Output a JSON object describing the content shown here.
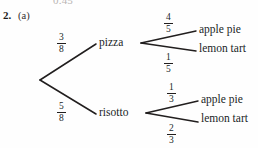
{
  "page": {
    "cut_off_text_above": "0.45",
    "question_number": "2.",
    "question_part": "(a)",
    "ink_color": "#211e1e",
    "background_color": "#fefefe"
  },
  "tree": {
    "root_label": "",
    "level1": [
      {
        "id": "pizza",
        "label": "pizza",
        "probability_numerator": "3",
        "probability_denominator": "8",
        "children": [
          {
            "id": "pizza-apple-pie",
            "label": "apple pie",
            "probability_numerator": "4",
            "probability_denominator": "5"
          },
          {
            "id": "pizza-lemon-tart",
            "label": "lemon tart",
            "probability_numerator": "1",
            "probability_denominator": "5"
          }
        ]
      },
      {
        "id": "risotto",
        "label": "risotto",
        "probability_numerator": "5",
        "probability_denominator": "8",
        "children": [
          {
            "id": "risotto-apple-pie",
            "label": "apple pie",
            "probability_numerator": "1",
            "probability_denominator": "3"
          },
          {
            "id": "risotto-lemon-tart",
            "label": "lemon tart",
            "probability_numerator": "2",
            "probability_denominator": "3"
          }
        ]
      }
    ]
  }
}
